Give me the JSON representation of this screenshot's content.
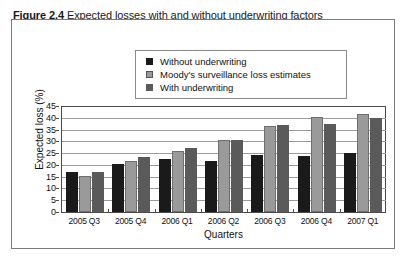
{
  "figure": {
    "caption_label": "Figure 2.4",
    "caption_text": "Expected losses with and without underwriting factors"
  },
  "legend": {
    "items": [
      {
        "label": "Without underwriting",
        "color": "#1a1a1a",
        "swatch": "legend-swatch-black"
      },
      {
        "label": "Moody's surveillance loss estimates",
        "color": "#9a9a9a",
        "swatch": "legend-swatch-gray"
      },
      {
        "label": "With underwriting",
        "color": "#5a5a5a",
        "swatch": "legend-swatch-dark-gray"
      }
    ]
  },
  "axes": {
    "y_title": "Expected loss (%)",
    "x_title": "Quarters",
    "y_ticks": [
      "45",
      "40",
      "35",
      "30",
      "25",
      "20",
      "15",
      "10",
      "5",
      "0"
    ]
  },
  "chart_data": {
    "type": "bar",
    "title": "Expected losses with and without underwriting factors",
    "xlabel": "Quarters",
    "ylabel": "Expected loss (%)",
    "ylim": [
      0,
      45
    ],
    "ytick_step": 5,
    "grid": true,
    "legend_position": "top-center",
    "categories": [
      "2005 Q3",
      "2005 Q4",
      "2006 Q1",
      "2006 Q2",
      "2006 Q3",
      "2006 Q4",
      "2007 Q1"
    ],
    "series": [
      {
        "name": "Without underwriting",
        "color": "#1a1a1a",
        "values": [
          16.8,
          20.2,
          22.5,
          21.8,
          24.3,
          23.9,
          24.9
        ]
      },
      {
        "name": "Moody's surveillance loss estimates",
        "color": "#9a9a9a",
        "values": [
          15.3,
          21.8,
          25.8,
          30.7,
          36.5,
          40.3,
          41.5
        ]
      },
      {
        "name": "With underwriting",
        "color": "#5a5a5a",
        "values": [
          16.8,
          23.5,
          27.3,
          30.6,
          37.0,
          37.2,
          40.0
        ]
      }
    ]
  }
}
